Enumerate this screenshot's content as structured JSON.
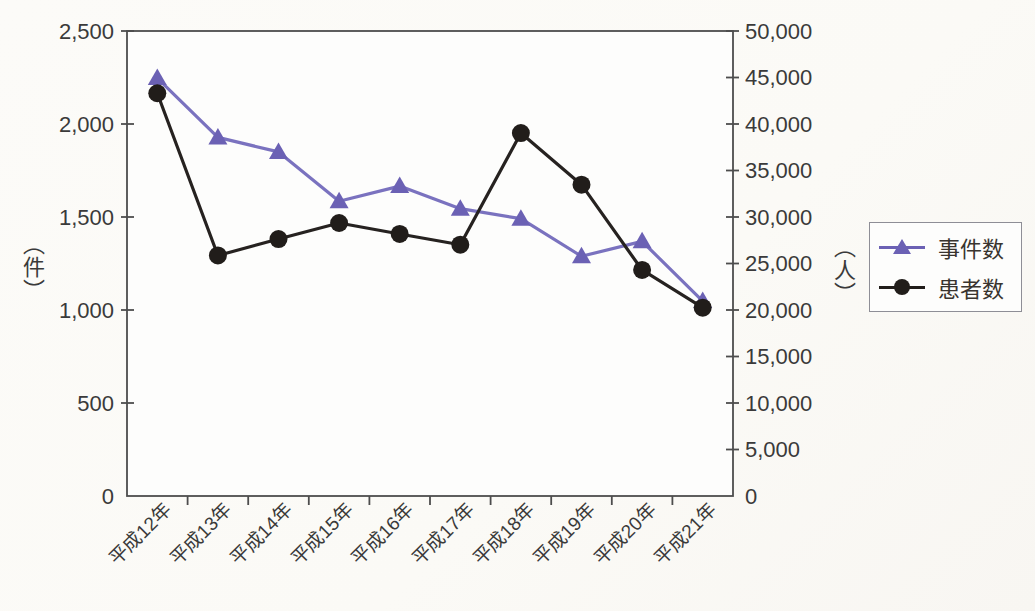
{
  "chart_data": {
    "type": "line",
    "categories": [
      "平成12年",
      "平成13年",
      "平成14年",
      "平成15年",
      "平成16年",
      "平成17年",
      "平成18年",
      "平成19年",
      "平成20年",
      "平成21年"
    ],
    "series": [
      {
        "name": "事件数",
        "axis": "left",
        "marker": "triangle",
        "color": "#6b61b4",
        "line_color": "#7a72bf",
        "values": [
          2247,
          1928,
          1850,
          1585,
          1666,
          1545,
          1491,
          1289,
          1369,
          1048
        ]
      },
      {
        "name": "患者数",
        "axis": "right",
        "marker": "circle",
        "color": "#211d1a",
        "line_color": "#262220",
        "values": [
          43307,
          25862,
          27629,
          29355,
          28175,
          27019,
          39026,
          33477,
          24303,
          20249
        ]
      }
    ],
    "left_axis": {
      "unit_label": "（件）",
      "min": 0,
      "max": 2500,
      "tick_step": 500,
      "tick_labels": [
        "0",
        "500",
        "1,000",
        "1,500",
        "2,000",
        "2,500"
      ]
    },
    "right_axis": {
      "unit_label": "（人）",
      "min": 0,
      "max": 50000,
      "tick_step": 5000,
      "tick_labels": [
        "0",
        "5,000",
        "10,000",
        "15,000",
        "20,000",
        "25,000",
        "30,000",
        "35,000",
        "40,000",
        "45,000",
        "50,000"
      ]
    },
    "legend": {
      "position": "outside-right-middle",
      "entries": [
        {
          "label": "事件数",
          "marker": "triangle",
          "color": "#6b61b4"
        },
        {
          "label": "患者数",
          "marker": "circle",
          "color": "#211d1a"
        }
      ]
    },
    "grid": false,
    "x_tick_style": "between-categories",
    "plot_frame": "full-box"
  },
  "colors": {
    "page_bg": "#fbfaf7",
    "plot_bg": "#fdfdfc",
    "axis": "#4d4d4d",
    "text": "#3a3a3a",
    "legend_border": "#8e8e96"
  }
}
